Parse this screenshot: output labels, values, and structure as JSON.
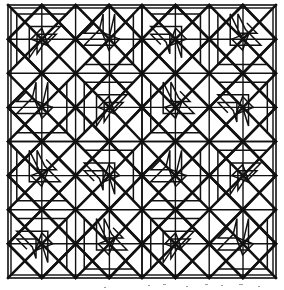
{
  "figure": {
    "style": "black line drawing on white ground",
    "line_color": "#111111",
    "background_color": "#ffffff"
  },
  "canvas": {
    "width": 284,
    "height": 290
  },
  "chart_data": {
    "type": "diagram",
    "frame": {
      "x0": 8,
      "y0": 5,
      "x1": 276,
      "y1": 278,
      "double_border": true,
      "inner_inset": 3
    },
    "grid": {
      "center_x": 142,
      "center_y": 141.5,
      "quadrant_cols": 2,
      "quadrant_rows": 2,
      "cells_per_quadrant": 2,
      "cell_size_x": 66.8,
      "cell_size_y": 68.1,
      "node_xs": [
        8,
        41.8,
        75.6,
        109.4,
        142,
        175.4,
        209.2,
        243,
        276
      ],
      "node_ys": [
        5,
        39.2,
        73.3,
        107.4,
        141.5,
        175.6,
        209.7,
        243.8,
        278
      ]
    },
    "motif": {
      "name": "diamond-with-spiral",
      "diamond_vertices_relative": [
        [
          0.5,
          0
        ],
        [
          1,
          0.5
        ],
        [
          0.5,
          1
        ],
        [
          0,
          0.5
        ]
      ],
      "spiral_turns": 3,
      "spiral_direction_alternates": true
    },
    "symmetry": {
      "type": "mirror",
      "axes": [
        "vertical-center",
        "horizontal-center"
      ],
      "order": 4
    },
    "counts": {
      "lattice_nodes": 81,
      "diamond_motifs": 16,
      "quadrants": 4
    }
  }
}
